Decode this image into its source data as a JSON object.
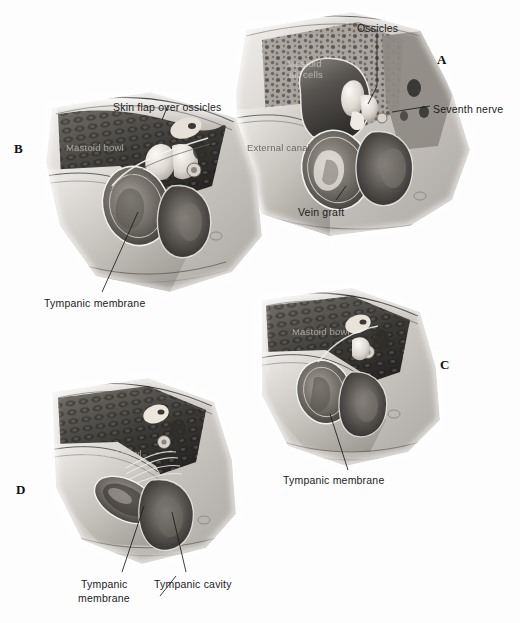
{
  "figure": {
    "medium": "grayscale anatomical airbrush illustration",
    "background_color": "#fdfdfd",
    "ink_color": "#1b1b1b",
    "panel_count": 4
  },
  "panels": [
    {
      "letter": "A",
      "caption": "Mastoid bowl opened, ossicles exposed with vein graft in external canal",
      "letter_pos": {
        "x": 437,
        "y": 52
      },
      "labels": [
        {
          "text": "Ossicles",
          "x": 357,
          "y": 22,
          "leader": true
        },
        {
          "text": "Seventh nerve",
          "x": 433,
          "y": 103,
          "leader": true
        },
        {
          "text": "External canal",
          "x": 247,
          "y": 141,
          "leader": false,
          "on_art": true
        },
        {
          "text": "Vein graft",
          "x": 298,
          "y": 206,
          "leader": true
        },
        {
          "text": "Mastoid",
          "x": 287,
          "y": 57,
          "leader": false,
          "on_art": true,
          "dark": true
        },
        {
          "text": "air cells",
          "x": 289,
          "y": 68,
          "leader": false,
          "on_art": true,
          "dark": true
        }
      ]
    },
    {
      "letter": "B",
      "caption": "Skin flap laid over ossicles, tympanic membrane below",
      "letter_pos": {
        "x": 14,
        "y": 141
      },
      "labels": [
        {
          "text": "Skin flap over ossicles",
          "x": 113,
          "y": 101,
          "leader": true
        },
        {
          "text": "Mastoid bowl",
          "x": 66,
          "y": 141,
          "leader": false,
          "on_art": true,
          "dark": true
        },
        {
          "text": "Tympanic membrane",
          "x": 44,
          "y": 297,
          "leader": true
        }
      ]
    },
    {
      "letter": "C",
      "caption": "Healed mastoid bowl with reconstructed tympanic membrane",
      "letter_pos": {
        "x": 440,
        "y": 357
      },
      "labels": [
        {
          "text": "Mastoid bowl",
          "x": 292,
          "y": 325,
          "leader": false,
          "on_art": true,
          "dark": true
        },
        {
          "text": "Tympanic membrane",
          "x": 283,
          "y": 474,
          "leader": true
        }
      ]
    },
    {
      "letter": "D",
      "caption": "Final result showing tympanic membrane and tympanic cavity",
      "letter_pos": {
        "x": 16,
        "y": 482
      },
      "labels": [
        {
          "text": "Mastoid bowl",
          "x": 84,
          "y": 447,
          "leader": false,
          "on_art": true,
          "dark": true
        },
        {
          "text": "Tympanic",
          "x": 81,
          "y": 578,
          "leader": true
        },
        {
          "text": "membrane",
          "x": 78,
          "y": 592,
          "leader": false
        },
        {
          "text": "Tympanic cavity",
          "x": 154,
          "y": 578,
          "leader": true
        }
      ]
    }
  ],
  "anatomy_terms": [
    "Ossicles",
    "Seventh nerve",
    "External canal",
    "Vein graft",
    "Mastoid air cells",
    "Mastoid bowl",
    "Skin flap over ossicles",
    "Tympanic membrane",
    "Tympanic cavity"
  ]
}
